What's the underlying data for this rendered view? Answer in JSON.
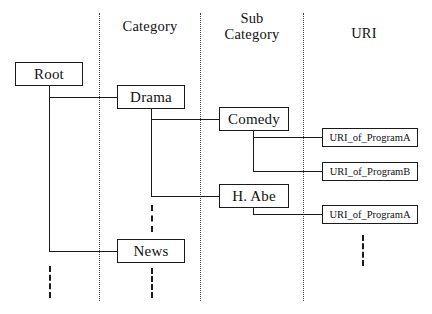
{
  "diagram": {
    "columns": [
      {
        "id": "root",
        "label": ""
      },
      {
        "id": "category",
        "label": "Category"
      },
      {
        "id": "sub_category",
        "label": "Sub\nCategory"
      },
      {
        "id": "uri",
        "label": "URI"
      }
    ],
    "nodes": {
      "root": "Root",
      "drama": "Drama",
      "news": "News",
      "comedy": "Comedy",
      "h_abe": "H. Abe",
      "uri_a1": "URI_of_ProgramA",
      "uri_b1": "URI_of_ProgramB",
      "uri_a2": "URI_of_ProgramA"
    },
    "colors": {
      "stroke": "#1a1a1a",
      "separator": "#3b3b3b",
      "background": "#ffffff",
      "text": "#111111"
    }
  }
}
